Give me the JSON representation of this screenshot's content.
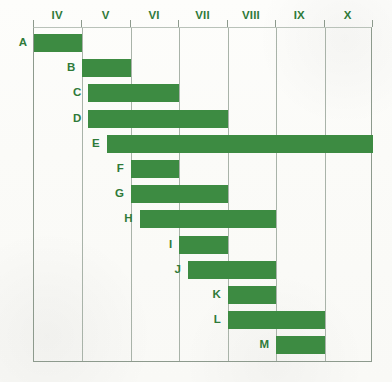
{
  "chart_data": {
    "type": "bar",
    "orientation": "horizontal",
    "subtype": "gantt",
    "title": "",
    "subtitle": "",
    "xlabel": "",
    "ylabel": "",
    "grid": true,
    "legend": null,
    "bar_color": "#3d8b42",
    "grid_color": "#a9b3a9",
    "label_color": "#2f7a39",
    "x_axis_position": "top",
    "x_tick_labels": [
      "IV",
      "V",
      "VI",
      "VII",
      "VIII",
      "IX",
      "X"
    ],
    "x_tick_values": [
      4,
      5,
      6,
      7,
      8,
      9,
      10
    ],
    "xlim": [
      4,
      11
    ],
    "categories": [
      "A",
      "B",
      "C",
      "D",
      "E",
      "F",
      "G",
      "H",
      "I",
      "J",
      "K",
      "L",
      "M"
    ],
    "bars": [
      {
        "label": "A",
        "start": 4.0,
        "end": 5.0,
        "duration": 1.0
      },
      {
        "label": "B",
        "start": 5.0,
        "end": 6.0,
        "duration": 1.0
      },
      {
        "label": "C",
        "start": 5.12,
        "end": 7.0,
        "duration": 1.88
      },
      {
        "label": "D",
        "start": 5.12,
        "end": 8.0,
        "duration": 2.88
      },
      {
        "label": "E",
        "start": 5.5,
        "end": 11.0,
        "duration": 5.5
      },
      {
        "label": "F",
        "start": 6.0,
        "end": 7.0,
        "duration": 1.0
      },
      {
        "label": "G",
        "start": 6.0,
        "end": 8.0,
        "duration": 2.0
      },
      {
        "label": "H",
        "start": 6.18,
        "end": 9.0,
        "duration": 2.82
      },
      {
        "label": "I",
        "start": 7.0,
        "end": 8.0,
        "duration": 1.0
      },
      {
        "label": "J",
        "start": 7.18,
        "end": 9.0,
        "duration": 1.82
      },
      {
        "label": "K",
        "start": 8.0,
        "end": 9.0,
        "duration": 1.0
      },
      {
        "label": "L",
        "start": 8.0,
        "end": 10.0,
        "duration": 2.0
      },
      {
        "label": "M",
        "start": 9.0,
        "end": 10.0,
        "duration": 1.0
      }
    ]
  }
}
